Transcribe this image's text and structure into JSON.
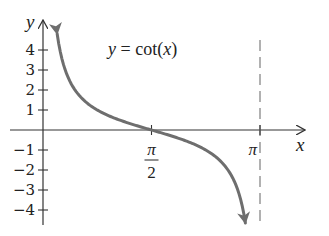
{
  "chart_data": {
    "type": "line",
    "title": "y = cot(x)",
    "title_parts": {
      "lhs": "y",
      "eq": " = cot(",
      "arg": "x",
      "close": ")"
    },
    "xlabel": "x",
    "ylabel": "y",
    "xlim": [
      0,
      3.4
    ],
    "ylim": [
      -4.8,
      5.5
    ],
    "x_ticks": [
      {
        "value": 1.5708,
        "label_num": "π",
        "label_den": "2",
        "label": "π/2"
      },
      {
        "value": 3.1416,
        "label": "π"
      }
    ],
    "y_ticks": [
      {
        "value": 4,
        "label": "4"
      },
      {
        "value": 3,
        "label": "3"
      },
      {
        "value": 2,
        "label": "2"
      },
      {
        "value": 1,
        "label": "1"
      },
      {
        "value": -1,
        "label": "−1"
      },
      {
        "value": -2,
        "label": "−2"
      },
      {
        "value": -3,
        "label": "−3"
      },
      {
        "value": -4,
        "label": "−4"
      }
    ],
    "grid": false,
    "asymptotes": [
      {
        "x": 3.1416,
        "style": "dashed"
      }
    ],
    "series": [
      {
        "name": "cot(x)",
        "color": "#6e6e6e",
        "x_range": [
          0.205,
          2.93
        ],
        "x": [
          0.205,
          0.25,
          0.3,
          0.4,
          0.5,
          0.6,
          0.8,
          1.0,
          1.2,
          1.4,
          1.5708,
          1.8,
          2.0,
          2.2,
          2.4,
          2.6,
          2.8,
          2.93
        ],
        "y": [
          4.81,
          3.92,
          3.23,
          2.37,
          1.83,
          1.46,
          0.97,
          0.64,
          0.39,
          0.17,
          0.0,
          -0.23,
          -0.46,
          -0.73,
          -1.09,
          -1.66,
          -2.8,
          -4.64
        ],
        "arrows": "both"
      }
    ]
  },
  "colors": {
    "axis": "#333333",
    "curve": "#6e6e6e",
    "asymptote": "#888888",
    "text": "#222222"
  }
}
